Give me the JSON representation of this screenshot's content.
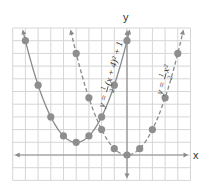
{
  "chart_data": {
    "type": "line",
    "title": "",
    "xlabel": "x",
    "ylabel": "y",
    "xlim": [
      -9,
      5
    ],
    "ylim": [
      -2,
      10
    ],
    "grid": true,
    "legend_position": "inline-labels",
    "series": [
      {
        "name": "y = 1/2(x + 4)^2 + 1",
        "label_parts": {
          "lhs": "y =",
          "num": "1",
          "den": "2",
          "rhs": "(x + 4)² + 1"
        },
        "style": "solid",
        "color": "#8a8a8a",
        "points": [
          {
            "x": -8,
            "y": 9
          },
          {
            "x": -7,
            "y": 5.5
          },
          {
            "x": -6,
            "y": 3
          },
          {
            "x": -5,
            "y": 1.5
          },
          {
            "x": -4,
            "y": 1
          },
          {
            "x": -3,
            "y": 1.5
          },
          {
            "x": -2,
            "y": 3
          },
          {
            "x": -1,
            "y": 5.5
          },
          {
            "x": 0,
            "y": 9
          }
        ]
      },
      {
        "name": "y = 1/2x^2",
        "label_parts": {
          "lhs": "y =",
          "num": "1",
          "den": "2",
          "rhs": "x²"
        },
        "style": "dashed",
        "color": "#8a8a8a",
        "points": [
          {
            "x": -4,
            "y": 8
          },
          {
            "x": -3,
            "y": 4.5
          },
          {
            "x": -2,
            "y": 2
          },
          {
            "x": -1,
            "y": 0.5
          },
          {
            "x": 0,
            "y": 0
          },
          {
            "x": 1,
            "y": 0.5
          },
          {
            "x": 2,
            "y": 2
          },
          {
            "x": 3,
            "y": 4.5
          },
          {
            "x": 4,
            "y": 8
          }
        ]
      }
    ]
  },
  "colors": {
    "grid": "#d6d6d6",
    "axis": "#8c8c8c",
    "curve": "#8a8a8a",
    "point": "#8e8e8e"
  },
  "axes": {
    "x_label": "x",
    "y_label": "y"
  }
}
